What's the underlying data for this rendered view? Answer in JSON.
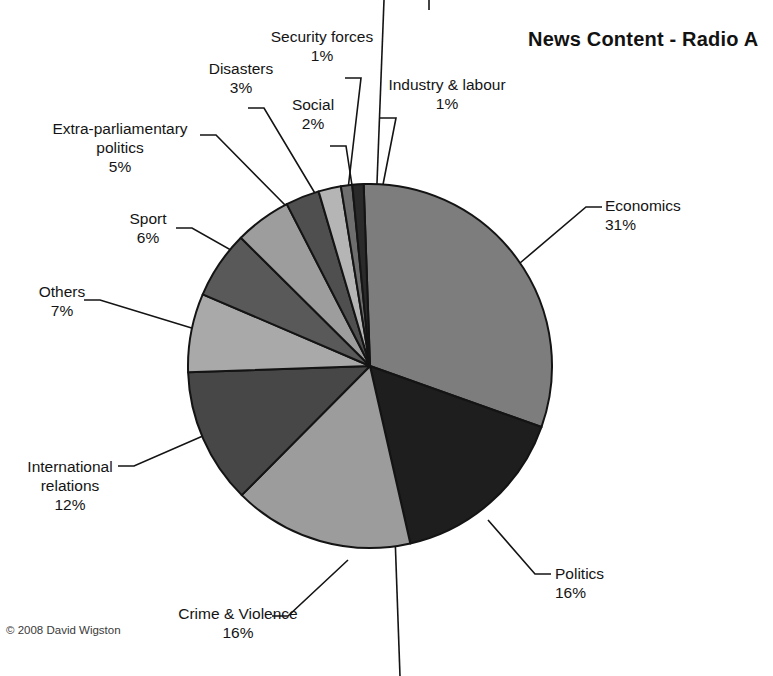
{
  "chart_data": {
    "type": "pie",
    "title": "News Content  - Radio A",
    "xlabel": "",
    "ylabel": "",
    "legend_position": "none",
    "grid": false,
    "start_angle_deg": -2,
    "direction": "clockwise",
    "categories": [
      "Economics",
      "Politics",
      "Crime & Violence",
      "International relations",
      "Others",
      "Sport",
      "Extra-parliamentary politics",
      "Disasters",
      "Social",
      "Security forces",
      "Industry & labour"
    ],
    "values": [
      31,
      16,
      16,
      12,
      7,
      6,
      5,
      3,
      2,
      1,
      1
    ],
    "value_suffix": "%",
    "colors": [
      "#7d7d7d",
      "#1e1e1e",
      "#9c9c9c",
      "#474747",
      "#a9a9a9",
      "#595959",
      "#9d9d9d",
      "#4f4f4f",
      "#b5b5b5",
      "#6e6e6e",
      "#2a2a2a"
    ]
  },
  "title": {
    "text": "News Content  - Radio A"
  },
  "labels": [
    {
      "name": "economics",
      "category": "Economics",
      "percent": "31%"
    },
    {
      "name": "politics",
      "category": "Politics",
      "percent": "16%"
    },
    {
      "name": "crime-violence",
      "category": "Crime & Violence",
      "percent": "16%"
    },
    {
      "name": "international",
      "category": "International relations",
      "percent": "12%",
      "line1": "International",
      "line2": "relations"
    },
    {
      "name": "others",
      "category": "Others",
      "percent": "7%"
    },
    {
      "name": "sport",
      "category": "Sport",
      "percent": "6%"
    },
    {
      "name": "extra-parliamentary",
      "category": "Extra-parliamentary politics",
      "percent": "5%",
      "line1": "Extra-parliamentary",
      "line2": "politics"
    },
    {
      "name": "disasters",
      "category": "Disasters",
      "percent": "3%"
    },
    {
      "name": "social",
      "category": "Social",
      "percent": "2%"
    },
    {
      "name": "security-forces",
      "category": "Security forces",
      "percent": "1%"
    },
    {
      "name": "industry-labour",
      "category": "Industry & labour",
      "percent": "1%"
    }
  ],
  "label_text": {
    "economics": "Economics",
    "economics_pct": "31%",
    "politics": "Politics",
    "politics_pct": "16%",
    "crime": "Crime & Violence",
    "crime_pct": "16%",
    "international_l1": "International",
    "international_l2": "relations",
    "international_pct": "12%",
    "others": "Others",
    "others_pct": "7%",
    "sport": "Sport",
    "sport_pct": "6%",
    "extra_l1": "Extra-parliamentary",
    "extra_l2": "politics",
    "extra_pct": "5%",
    "disasters": "Disasters",
    "disasters_pct": "3%",
    "social": "Social",
    "social_pct": "2%",
    "security": "Security forces",
    "security_pct": "1%",
    "industry": "Industry & labour",
    "industry_pct": "1%"
  },
  "copyright": {
    "text": "© 2008 David Wigston"
  },
  "geometry": {
    "center_x": 370,
    "center_y": 366,
    "radius": 182,
    "stroke": "#141414",
    "stroke_width": 2
  }
}
